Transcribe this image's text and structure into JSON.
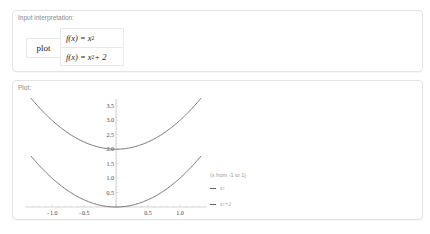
{
  "input_pod": {
    "title": "Input interpretation:",
    "command": "plot",
    "functions": [
      {
        "lhs": "f(x) = x",
        "exp": "2",
        "rhs": ""
      },
      {
        "lhs": "f(x) = x",
        "exp": "2",
        "rhs": " + 2"
      }
    ]
  },
  "plot_pod": {
    "title": "Plot:",
    "legend": {
      "range": "(x from -1 to 1)",
      "items": [
        {
          "base": "x",
          "exp": "2",
          "rest": "",
          "color": "#666666"
        },
        {
          "base": "x",
          "exp": "2",
          "rest": "+2",
          "color": "#666666"
        }
      ]
    }
  },
  "chart_data": {
    "type": "line",
    "title": "",
    "xlabel": "",
    "ylabel": "",
    "xlim": [
      -1.35,
      1.35
    ],
    "ylim": [
      0,
      3.8
    ],
    "x_ticks": [
      "-1.0",
      "-0.5",
      "0.5",
      "1.0"
    ],
    "y_ticks": [
      "0.5",
      "1.0",
      "1.5",
      "2.0",
      "2.5",
      "3.0",
      "3.5"
    ],
    "grid": false,
    "legend_position": "right",
    "series": [
      {
        "name": "x^2",
        "x": [
          -1.33,
          -1.0,
          -0.5,
          0,
          0.5,
          1.0,
          1.33
        ],
        "values": [
          1.77,
          1.0,
          0.25,
          0,
          0.25,
          1.0,
          1.77
        ]
      },
      {
        "name": "x^2+2",
        "x": [
          -1.33,
          -1.0,
          -0.5,
          0,
          0.5,
          1.0,
          1.33
        ],
        "values": [
          3.77,
          3.0,
          2.25,
          2.0,
          2.25,
          3.0,
          3.77
        ]
      }
    ]
  }
}
